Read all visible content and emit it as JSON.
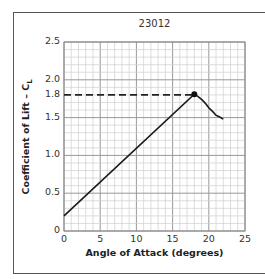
{
  "chart_data": {
    "type": "line",
    "title": "23012",
    "xlabel": "Angle of Attack  (degrees)",
    "ylabel": "Coefficient of Lift – C",
    "ylabel_subscript": "L",
    "xlim": [
      0,
      25
    ],
    "ylim": [
      0,
      2.5
    ],
    "x_ticks": [
      "0",
      "5",
      "10",
      "15",
      "20",
      "25"
    ],
    "y_ticks": [
      "0",
      "0.5",
      "1.0",
      "1.5",
      "1.8",
      "2.0",
      "2.5"
    ],
    "grid": true,
    "series": [
      {
        "name": "23012 lift curve",
        "x": [
          0,
          5,
          10,
          15,
          18,
          19,
          20,
          21,
          22
        ],
        "y": [
          0.2,
          0.65,
          1.1,
          1.55,
          1.81,
          1.74,
          1.63,
          1.53,
          1.48
        ]
      }
    ],
    "annotations": [
      {
        "type": "marker",
        "x": 18,
        "y": 1.81,
        "label": "max CL"
      },
      {
        "type": "dashed-hline",
        "y": 1.8,
        "from_x": 0,
        "to_x": 18
      }
    ]
  }
}
